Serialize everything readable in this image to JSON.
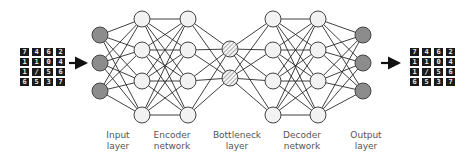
{
  "diagram": {
    "colors": {
      "io_node_fill": "#8c8c8c",
      "hidden_node_fill": "#f2f2f2",
      "bottleneck_hatch": "#8a8a8a",
      "edge": "#2a2a2a",
      "arrow": "#111111",
      "label_text": "#555555"
    },
    "input_images": {
      "rows": 4,
      "cols": 4,
      "digits": [
        "7",
        "4",
        "6",
        "2",
        "1",
        "1",
        "0",
        "4",
        "1",
        "/",
        "5",
        "6",
        "6",
        "5",
        "3",
        "7"
      ]
    },
    "output_images": {
      "rows": 4,
      "cols": 4,
      "digits": [
        "7",
        "4",
        "6",
        "2",
        "1",
        "1",
        "0",
        "4",
        "1",
        "/",
        "5",
        "6",
        "6",
        "5",
        "3",
        "7"
      ]
    },
    "layers": [
      {
        "name": "input",
        "x": 100,
        "nodes": [
          35,
          63,
          91
        ],
        "style": "io"
      },
      {
        "name": "encoder-1",
        "x": 142,
        "nodes": [
          19,
          50,
          81,
          115
        ],
        "style": "hidden"
      },
      {
        "name": "encoder-2",
        "x": 188,
        "nodes": [
          19,
          50,
          81,
          115
        ],
        "style": "hidden"
      },
      {
        "name": "bottleneck",
        "x": 230,
        "nodes": [
          49,
          78
        ],
        "style": "bottleneck"
      },
      {
        "name": "decoder-1",
        "x": 273,
        "nodes": [
          19,
          50,
          81,
          115
        ],
        "style": "hidden"
      },
      {
        "name": "decoder-2",
        "x": 318,
        "nodes": [
          19,
          50,
          81,
          115
        ],
        "style": "hidden"
      },
      {
        "name": "output",
        "x": 363,
        "nodes": [
          35,
          63,
          91
        ],
        "style": "io"
      }
    ],
    "labels": {
      "input": {
        "line1": "Input",
        "line2": "layer"
      },
      "encoder": {
        "line1": "Encoder",
        "line2": "network"
      },
      "bottleneck": {
        "line1": "Bottleneck",
        "line2": "layer"
      },
      "decoder": {
        "line1": "Decoder",
        "line2": "network"
      },
      "output": {
        "line1": "Output",
        "line2": "layer"
      }
    }
  }
}
